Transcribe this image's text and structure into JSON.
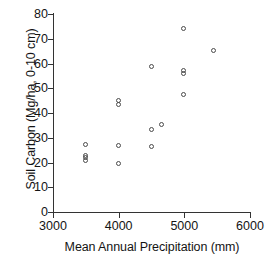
{
  "chart_data": {
    "type": "scatter",
    "title": "",
    "xlabel": "Mean Annual Precipitation (mm)",
    "ylabel": "Soil Carbon (Mg/ha, 0-10 cm)",
    "xlim": [
      3000,
      6000
    ],
    "ylim": [
      0,
      80
    ],
    "xticks": [
      3000,
      4000,
      5000,
      6000
    ],
    "yticks": [
      0,
      10,
      20,
      30,
      40,
      50,
      60,
      70,
      80
    ],
    "xtick_labels": [
      "3000",
      "4000",
      "5000",
      "6000"
    ],
    "ytick_labels": [
      "0",
      "10",
      "20",
      "30",
      "40",
      "50",
      "60",
      "70",
      "80"
    ],
    "grid": false,
    "legend": false,
    "marker": "open-circle",
    "marker_color": "#4a4a4a",
    "points": [
      {
        "x": 3500,
        "y": 27.2
      },
      {
        "x": 3495,
        "y": 23.0
      },
      {
        "x": 3495,
        "y": 22.0
      },
      {
        "x": 3495,
        "y": 21.0
      },
      {
        "x": 4000,
        "y": 45.2
      },
      {
        "x": 4000,
        "y": 43.6
      },
      {
        "x": 4000,
        "y": 27.0
      },
      {
        "x": 4000,
        "y": 19.4
      },
      {
        "x": 4500,
        "y": 58.6
      },
      {
        "x": 4500,
        "y": 33.2
      },
      {
        "x": 4495,
        "y": 26.4
      },
      {
        "x": 4650,
        "y": 35.4
      },
      {
        "x": 4990,
        "y": 74.0
      },
      {
        "x": 4990,
        "y": 57.2
      },
      {
        "x": 4990,
        "y": 56.0
      },
      {
        "x": 4990,
        "y": 47.3
      },
      {
        "x": 5450,
        "y": 65.4
      }
    ]
  }
}
